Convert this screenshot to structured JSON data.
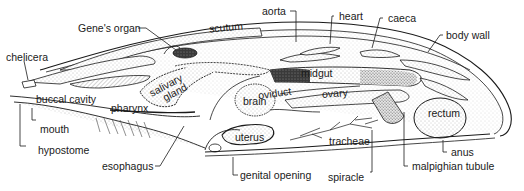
{
  "figure": {
    "labels": {
      "genes_organ": "Gene's organ",
      "scutum": "scutum",
      "aorta": "aorta",
      "heart": "heart",
      "caeca": "caeca",
      "body_wall": "body wall",
      "chelicera": "chelicera",
      "buccal_cavity": "buccal cavity",
      "salivary_gland": "salivary gland",
      "salivary": "salivary",
      "gland": "gland",
      "brain": "brain",
      "oviduct": "oviduct",
      "midgut": "midgut",
      "ovary": "ovary",
      "rectum": "rectum",
      "mouth": "mouth",
      "pharynx": "pharynx",
      "hypostome": "hypostome",
      "uterus": "uterus",
      "tracheae": "tracheae",
      "anus": "anus",
      "esophagus": "esophagus",
      "genital_opening": "genital opening",
      "spiracle": "spiracle",
      "malpighian_tubule": "malpighian tubule"
    },
    "colors": {
      "ink": "#1a1a1a",
      "stipple": "#9a9a9a",
      "dark_organ": "#2b2b2b",
      "background": "#ffffff"
    }
  }
}
